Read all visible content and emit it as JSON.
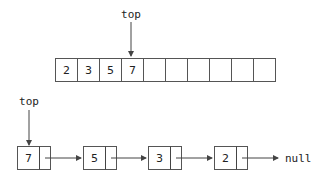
{
  "array_stack": {
    "pointer_label": "top",
    "cells": [
      "2",
      "3",
      "5",
      "7",
      "",
      "",
      "",
      "",
      "",
      ""
    ],
    "top_index": 3
  },
  "linked_stack": {
    "pointer_label": "top",
    "nodes": [
      "7",
      "5",
      "3",
      "2"
    ],
    "terminal_label": "null"
  }
}
